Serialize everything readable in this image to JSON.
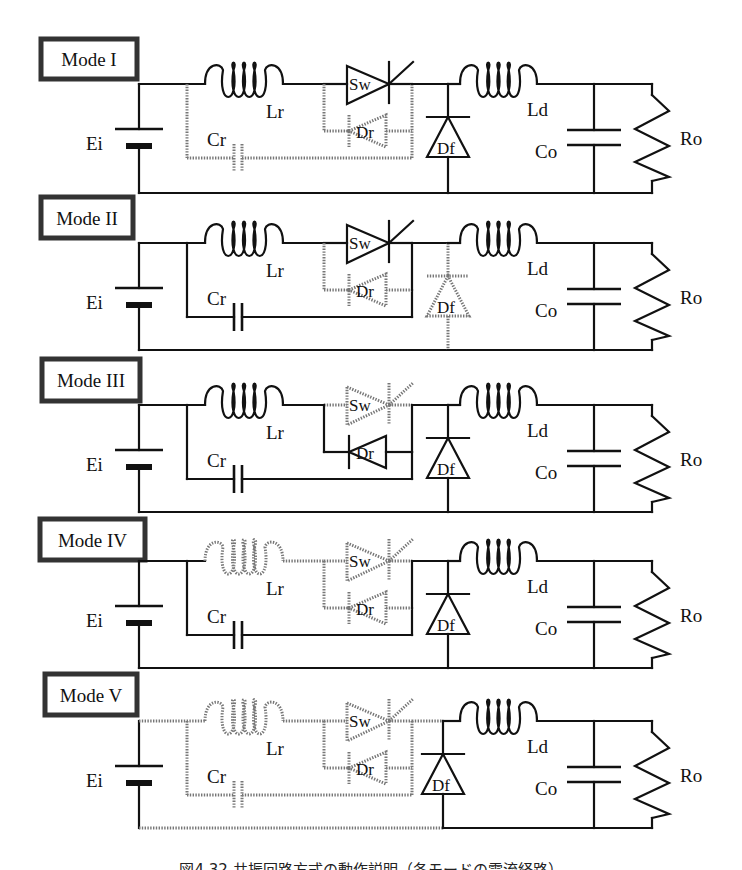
{
  "figure": {
    "type": "circuit-mode-diagram",
    "components": {
      "source": "Ei",
      "resonant_inductor": "Lr",
      "resonant_capacitor": "Cr",
      "switch": "Sw",
      "reverse_diode": "Dr",
      "freewheel_diode": "Df",
      "output_inductor": "Ld",
      "output_capacitor": "Co",
      "load_resistor": "Ro"
    },
    "legend_note": "solid = conducting path, dotted = inactive path",
    "colors": {
      "active": "#111111",
      "inactive": "#777777",
      "background": "#ffffff"
    },
    "modes": [
      {
        "label": "Mode I",
        "top": 84,
        "bottom": 193,
        "box": {
          "x": 41,
          "y": 39,
          "w": 96,
          "h": 40
        },
        "state": {
          "left_rail": "solid",
          "top_left": "solid",
          "Lr": "solid",
          "Cr_branch": "dotted",
          "Sw": "solid",
          "Dr_branch": "dotted",
          "right_link": "solid",
          "Df": "solid",
          "bottom_left": "solid"
        }
      },
      {
        "label": "Mode II",
        "top": 243,
        "bottom": 350,
        "box": {
          "x": 41,
          "y": 197,
          "w": 92,
          "h": 41
        },
        "state": {
          "left_rail": "solid",
          "top_left": "solid",
          "Lr": "solid",
          "Cr_branch": "solid",
          "Sw": "solid",
          "Dr_branch": "dotted",
          "right_link": "solid",
          "Df": "dotted",
          "bottom_left": "solid"
        }
      },
      {
        "label": "Mode III",
        "top": 405,
        "bottom": 512,
        "box": {
          "x": 42,
          "y": 359,
          "w": 98,
          "h": 42
        },
        "state": {
          "left_rail": "solid",
          "top_left": "solid",
          "Lr": "solid",
          "Cr_branch": "solid",
          "Sw": "dotted",
          "Dr_branch": "solid",
          "right_link": "solid",
          "Df": "solid",
          "bottom_left": "solid"
        }
      },
      {
        "label": "Mode IV",
        "top": 561,
        "bottom": 668,
        "box": {
          "x": 40,
          "y": 519,
          "w": 105,
          "h": 41
        },
        "state": {
          "left_rail": "solid",
          "top_left": "solid",
          "Lr": "dotted",
          "Cr_branch": "solid",
          "Sw": "dotted",
          "Dr_branch": "dotted",
          "right_link": "solid",
          "Df": "solid",
          "bottom_left": "solid"
        }
      },
      {
        "label": "Mode V",
        "top": 721,
        "bottom": 828,
        "box": {
          "x": 45,
          "y": 674,
          "w": 92,
          "h": 41
        },
        "state": {
          "left_rail": "solid",
          "top_left": "dotted",
          "Lr": "dotted",
          "Cr_branch": "dotted",
          "Sw": "dotted",
          "Dr_branch": "dotted",
          "right_link": "dotted",
          "Df": "solid",
          "bottom_left": "dotted"
        }
      }
    ],
    "caption": "図4.32 共振回路方式の動作説明（各モードの電流経路）"
  }
}
